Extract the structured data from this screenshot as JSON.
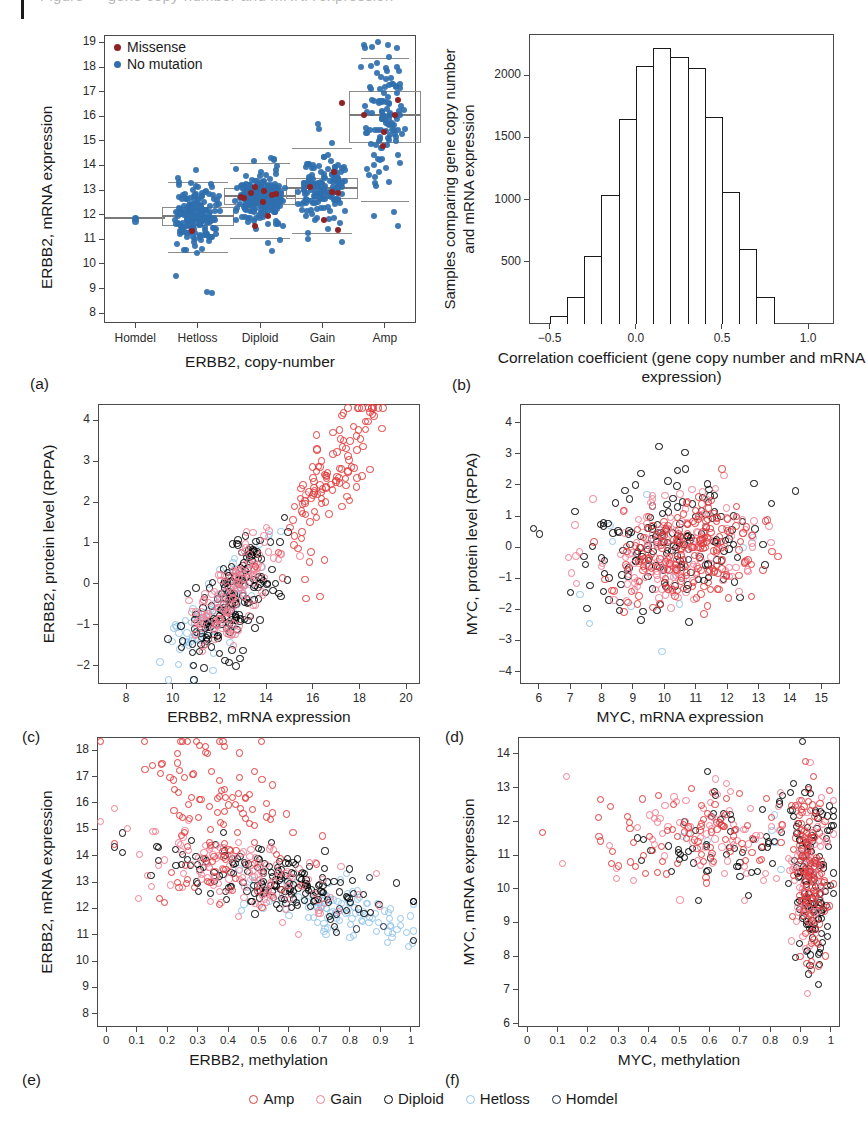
{
  "figure": {
    "top_cropped_caption": "Figure — gene copy-number and mRNA expression",
    "panels": [
      "a",
      "b",
      "c",
      "d",
      "e",
      "f"
    ]
  },
  "bottom_legend": {
    "items": [
      {
        "label": "Amp",
        "color": "#e03b3b",
        "marker": "open-circle"
      },
      {
        "label": "Gain",
        "color": "#ef7f93",
        "marker": "open-circle"
      },
      {
        "label": "Diploid",
        "color": "#000000",
        "marker": "open-circle"
      },
      {
        "label": "Hetloss",
        "color": "#93c6ea",
        "marker": "open-circle"
      },
      {
        "label": "Homdel",
        "color": "#18243f",
        "marker": "open-circle"
      }
    ]
  },
  "chart_data": [
    {
      "panel": "a",
      "letter": "(a)",
      "type": "box",
      "title": "",
      "xlabel": "ERBB2, copy-number",
      "ylabel": "ERBB2, mRNA expression",
      "categories": [
        "Homdel",
        "Hetloss",
        "Diploid",
        "Gain",
        "Amp"
      ],
      "ylim": [
        7.6,
        19.3
      ],
      "yticks": [
        8,
        9,
        10,
        11,
        12,
        13,
        14,
        15,
        16,
        17,
        18,
        19
      ],
      "legend": [
        {
          "label": "Missense",
          "color": "#8e2226",
          "marker": "filled-circle"
        },
        {
          "label": "No mutation",
          "color": "#2f6fae",
          "marker": "filled-circle"
        }
      ],
      "legend_position": "top-left",
      "boxes": [
        {
          "category": "Homdel",
          "n": 1,
          "min": 11.85,
          "q1": 11.85,
          "median": 11.85,
          "q3": 11.85,
          "max": 11.85
        },
        {
          "category": "Hetloss",
          "n": 215,
          "min": 10.48,
          "q1": 11.55,
          "median": 11.95,
          "q3": 12.32,
          "max": 13.32
        },
        {
          "category": "Diploid",
          "n": 240,
          "min": 11.07,
          "q1": 12.4,
          "median": 12.75,
          "q3": 13.07,
          "max": 14.1
        },
        {
          "category": "Gain",
          "n": 160,
          "min": 11.24,
          "q1": 12.65,
          "median": 13.08,
          "q3": 13.5,
          "max": 14.7
        },
        {
          "category": "Amp",
          "n": 120,
          "min": 12.55,
          "q1": 14.93,
          "median": 16.03,
          "q3": 17.02,
          "max": 18.35
        }
      ]
    },
    {
      "panel": "b",
      "letter": "(b)",
      "type": "bar",
      "subtype": "histogram",
      "title": "",
      "xlabel": "Correlation coefficient (gene copy number and mRNA expression)",
      "ylabel": "Samples comparing gene copy number and mRNA expression",
      "xlim": [
        -0.62,
        1.15
      ],
      "ylim": [
        0,
        2330
      ],
      "xticks": [
        -0.5,
        0.0,
        0.5,
        1.0
      ],
      "xticklabels": [
        "−0.5",
        "0.0",
        "0.5",
        "1.0"
      ],
      "yticks": [
        500,
        1000,
        1500,
        2000
      ],
      "bin_width": 0.1,
      "bin_starts": [
        -0.5,
        -0.4,
        -0.3,
        -0.2,
        -0.1,
        0.0,
        0.1,
        0.2,
        0.3,
        0.4,
        0.5,
        0.6,
        0.7
      ],
      "values": [
        65,
        215,
        545,
        1040,
        1645,
        2075,
        2220,
        2145,
        2060,
        1665,
        1060,
        605,
        215
      ],
      "grid": false
    },
    {
      "panel": "c",
      "letter": "(c)",
      "type": "scatter",
      "title": "",
      "xlabel": "ERBB2, mRNA expression",
      "ylabel": "ERBB2, protein level (RPPA)",
      "xlim": [
        6.8,
        20.6
      ],
      "ylim": [
        -2.45,
        4.4
      ],
      "xticks": [
        8,
        10,
        12,
        14,
        16,
        18,
        20
      ],
      "yticks": [
        -2,
        -1,
        0,
        1,
        2,
        3,
        4
      ],
      "yticklabels": [
        "−2",
        "−1",
        "0",
        "1",
        "2",
        "3",
        "4"
      ],
      "series": [
        {
          "name": "Amp",
          "color": "#e03b3b",
          "n": 118
        },
        {
          "name": "Gain",
          "color": "#ef7f93",
          "n": 150
        },
        {
          "name": "Diploid",
          "color": "#000000",
          "n": 170
        },
        {
          "name": "Hetloss",
          "color": "#93c6ea",
          "n": 95
        },
        {
          "name": "Homdel",
          "color": "#18243f",
          "n": 6
        }
      ],
      "trend": "strong positive correlation"
    },
    {
      "panel": "d",
      "letter": "(d)",
      "type": "scatter",
      "title": "",
      "xlabel": "MYC, mRNA expression",
      "ylabel": "MYC, protein level (RPPA)",
      "xlim": [
        5.4,
        15.6
      ],
      "ylim": [
        -4.4,
        4.6
      ],
      "xticks": [
        6,
        7,
        8,
        9,
        10,
        11,
        12,
        13,
        14,
        15
      ],
      "yticks": [
        -4,
        -3,
        -2,
        -1,
        0,
        1,
        2,
        3,
        4
      ],
      "yticklabels": [
        "−4",
        "−3",
        "−2",
        "−1",
        "0",
        "1",
        "2",
        "3",
        "4"
      ],
      "series": [
        {
          "name": "Amp",
          "color": "#e03b3b",
          "n": 180
        },
        {
          "name": "Gain",
          "color": "#ef7f93",
          "n": 170
        },
        {
          "name": "Diploid",
          "color": "#000000",
          "n": 160
        },
        {
          "name": "Hetloss",
          "color": "#93c6ea",
          "n": 14
        },
        {
          "name": "Homdel",
          "color": "#18243f",
          "n": 4
        }
      ],
      "trend": "weak positive correlation"
    },
    {
      "panel": "e",
      "letter": "(e)",
      "type": "scatter",
      "title": "",
      "xlabel": "ERBB2, methylation",
      "ylabel": "ERBB2, mRNA expression",
      "xlim": [
        -0.03,
        1.03
      ],
      "ylim": [
        7.5,
        18.5
      ],
      "xticks": [
        0.0,
        0.1,
        0.2,
        0.3,
        0.4,
        0.5,
        0.6,
        0.7,
        0.8,
        0.9,
        1.0
      ],
      "yticks": [
        8,
        9,
        10,
        11,
        12,
        13,
        14,
        15,
        16,
        17,
        18
      ],
      "series": [
        {
          "name": "Amp",
          "color": "#e03b3b",
          "n": 120
        },
        {
          "name": "Gain",
          "color": "#ef7f93",
          "n": 140
        },
        {
          "name": "Diploid",
          "color": "#000000",
          "n": 180
        },
        {
          "name": "Hetloss",
          "color": "#93c6ea",
          "n": 110
        },
        {
          "name": "Homdel",
          "color": "#18243f",
          "n": 5
        }
      ],
      "trend": "negative correlation"
    },
    {
      "panel": "f",
      "letter": "(f)",
      "type": "scatter",
      "title": "",
      "xlabel": "MYC, methylation",
      "ylabel": "MYC, mRNA expression",
      "xlim": [
        -0.03,
        1.03
      ],
      "ylim": [
        5.9,
        14.5
      ],
      "xticks": [
        0.0,
        0.1,
        0.2,
        0.3,
        0.4,
        0.5,
        0.6,
        0.7,
        0.8,
        0.9,
        1.0
      ],
      "yticks": [
        6,
        7,
        8,
        9,
        10,
        11,
        12,
        13,
        14
      ],
      "series": [
        {
          "name": "Amp",
          "color": "#e03b3b",
          "n": 200
        },
        {
          "name": "Gain",
          "color": "#ef7f93",
          "n": 170
        },
        {
          "name": "Diploid",
          "color": "#000000",
          "n": 190
        },
        {
          "name": "Hetloss",
          "color": "#93c6ea",
          "n": 10
        },
        {
          "name": "Homdel",
          "color": "#18243f",
          "n": 6
        }
      ],
      "trend": "negative correlation, dense at high methylation"
    }
  ]
}
